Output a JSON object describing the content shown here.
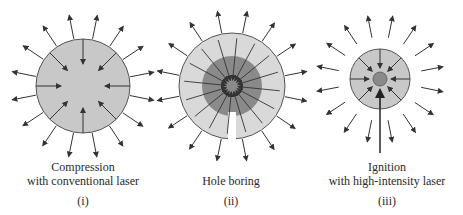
{
  "panels": [
    {
      "id": "i",
      "caption_line1": "Compression",
      "caption_line2": "with conventional laser",
      "label": "(i)"
    },
    {
      "id": "ii",
      "caption_line1": "Hole boring",
      "caption_line2": "",
      "label": "(ii)"
    },
    {
      "id": "iii",
      "caption_line1": "Ignition",
      "caption_line2": "with high-intensity laser",
      "label": "(iii)"
    }
  ],
  "colors": {
    "pellet_fill": "#c8c8c8",
    "outer_fill": "#d9d9d9",
    "core_dark": "#8a8a8a",
    "stroke": "#555555",
    "arrow": "#333333"
  }
}
